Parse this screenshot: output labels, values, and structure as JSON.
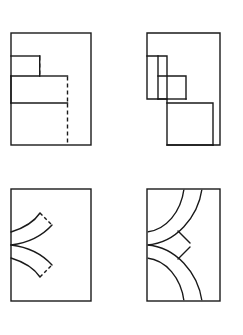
{
  "figure": {
    "background_color": "#ffffff",
    "line_color": "#1a1a1a",
    "canvas": {
      "width": 243,
      "height": 335
    },
    "panel_count": 4
  },
  "panels": [
    {
      "id": "panel-top-left",
      "label": "Top left panel",
      "position": "top-left",
      "frame": {
        "x": 11,
        "y": 33,
        "width": 80,
        "height": 112
      },
      "description": "Rectangular frame containing a descending two-step orthogonal profile with hidden (dashed) vertical edges",
      "style": "stepped-outline-with-hidden-lines",
      "solid_path": "M11,33 L91,33 L91,145 L11,145 Z M11,56 L39,56 M39,76 L67,76 M39,56 L39,76 M11,103 L67,103 M67,76 L67,103 M11,103 L11,145",
      "hidden_segments": [
        {
          "name": "hidden-edge-upper",
          "x1": 39,
          "y1": 56,
          "x2": 39,
          "y2": 76
        },
        {
          "name": "hidden-edge-middle",
          "x1": 67,
          "y1": 76,
          "x2": 67,
          "y2": 103
        },
        {
          "name": "hidden-edge-lower",
          "x1": 67,
          "y1": 103,
          "x2": 67,
          "y2": 145
        }
      ]
    },
    {
      "id": "panel-top-right",
      "label": "Top right panel",
      "position": "top-right",
      "frame": {
        "x": 147,
        "y": 33,
        "width": 73,
        "height": 112
      },
      "description": "Descending staircase solid outline of three steps, open profile without full enclosing rectangle",
      "style": "staircase-outline",
      "step_count": 3
    },
    {
      "id": "panel-bottom-left",
      "label": "Bottom left panel",
      "position": "bottom-left",
      "frame": {
        "x": 11,
        "y": 189,
        "width": 80,
        "height": 112
      },
      "description": "Rectangular frame containing two mirrored curved bands meeting at a point on the left frame edge",
      "style": "curved-bands-short",
      "band_count": 2
    },
    {
      "id": "panel-bottom-right",
      "label": "Bottom right panel",
      "position": "bottom-right",
      "frame": {
        "x": 147,
        "y": 189,
        "width": 73,
        "height": 112
      },
      "description": "Rectangular frame containing two mirrored concentric quarter-arc bands running from the top and bottom edges to a common point on the left frame edge",
      "style": "curved-bands-full",
      "band_count": 2,
      "arcs_per_band": 2
    }
  ],
  "geometry": {
    "stroke_width": 1.4,
    "dash_pattern": "4 3",
    "meeting_point_bottom_left": {
      "x": 11,
      "y": 245
    },
    "meeting_point_bottom_right": {
      "x": 147,
      "y": 245
    }
  }
}
